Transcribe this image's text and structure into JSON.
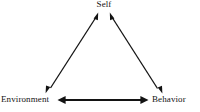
{
  "diagram": {
    "type": "triangle-relationship-diagram",
    "background_color": "#ffffff",
    "stroke_color": "#131313",
    "nodes": [
      {
        "id": "self",
        "label": "Self",
        "position": "top-center"
      },
      {
        "id": "environment",
        "label": "Environment",
        "position": "bottom-left"
      },
      {
        "id": "behavior",
        "label": "Behavior",
        "position": "bottom-right"
      }
    ],
    "connections": [
      {
        "id": "environment-self",
        "from": "Environment",
        "to": "Self",
        "style": "double-headed-arrow",
        "orientation": "diagonal-left",
        "stroke_width": 1.2
      },
      {
        "id": "self-behavior",
        "from": "Self",
        "to": "Behavior",
        "style": "double-headed-arrow",
        "orientation": "diagonal-right",
        "stroke_width": 1.2
      },
      {
        "id": "environment-behavior",
        "from": "Environment",
        "to": "Behavior",
        "style": "double-headed-arrow",
        "orientation": "horizontal",
        "stroke_width": 2.1
      }
    ]
  }
}
